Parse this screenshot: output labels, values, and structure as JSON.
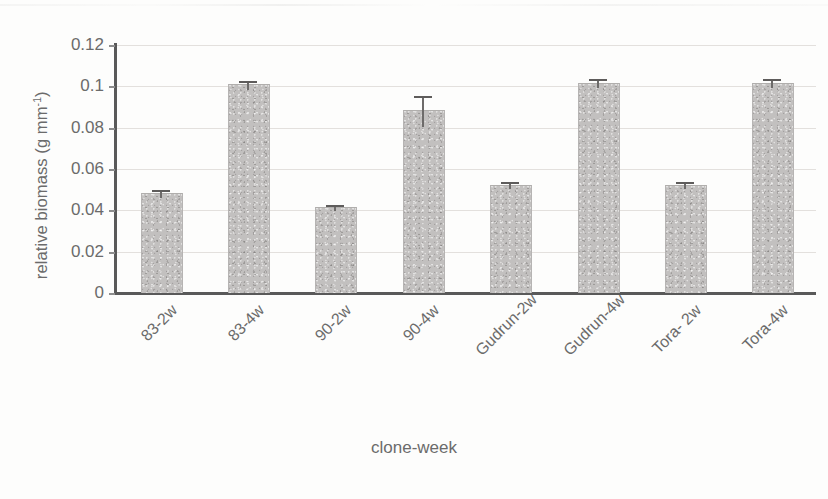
{
  "chart_data": {
    "type": "bar",
    "title": "",
    "xlabel": "clone-week",
    "ylabel_html": "relative biomass (g mm<sup>-1</sup>)",
    "ylabel_plain": "relative biomass (g mm-1)",
    "categories": [
      "83-2w",
      "83-4w",
      "90-2w",
      "90-4w",
      "Gudrun-2w",
      "Gudrun-4w",
      "Tora- 2w",
      "Tora-4w"
    ],
    "values": [
      0.048,
      0.1005,
      0.0412,
      0.088,
      0.052,
      0.1012,
      0.052,
      0.1012
    ],
    "errors": [
      0.0018,
      0.0022,
      0.0015,
      0.0075,
      0.0015,
      0.0022,
      0.0017,
      0.0022
    ],
    "ylim": [
      0,
      0.12
    ],
    "ytick_values": [
      0.12,
      0.1,
      0.08,
      0.06,
      0.04,
      0.02,
      0
    ],
    "ytick_labels": [
      "0.12",
      "0.1",
      "0.08",
      "0.06",
      "0.04",
      "0.02",
      "0"
    ],
    "grid": true,
    "grid_axis": "y",
    "legend": "none",
    "bar_color": "#c2c0bf",
    "error_color": "#5e5c5b",
    "axis_color": "#595959",
    "grid_color": "#e3e0dd",
    "text_color": "#6b6b6b",
    "background": "#fdfdfc"
  }
}
